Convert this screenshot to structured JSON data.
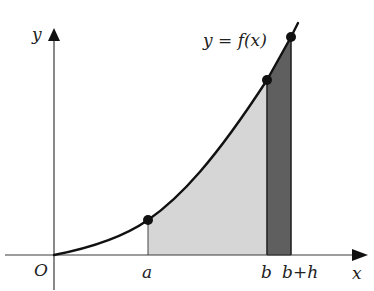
{
  "diagram": {
    "type": "area-under-curve",
    "curve_label": {
      "lhs": "y",
      "eq": " = ",
      "rhs": "f(x)"
    },
    "axes": {
      "x_label": "x",
      "y_label": "y",
      "origin_label": "O"
    },
    "ticks": {
      "a": "a",
      "b": "b",
      "b_plus_h": "b+h"
    },
    "regions": [
      {
        "name": "area-a-to-b",
        "from": "a",
        "to": "b",
        "color": "#d6d6d6"
      },
      {
        "name": "strip-b-to-b+h",
        "from": "b",
        "to": "b+h",
        "color": "#5f5f5f"
      }
    ],
    "points": [
      "(a, f(a))",
      "(b, f(b))",
      "(b+h, f(b+h))"
    ],
    "colors": {
      "axis": "#3a3a3a",
      "curve": "#111111",
      "light_fill": "#d6d6d6",
      "dark_fill": "#5f5f5f",
      "background": "#ffffff"
    }
  }
}
